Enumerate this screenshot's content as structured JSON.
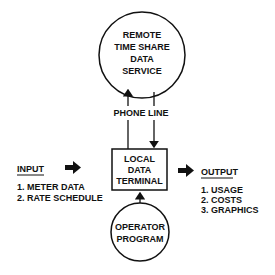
{
  "remote_service": {
    "lines": [
      "REMOTE",
      "TIME SHARE",
      "DATA",
      "SERVICE"
    ]
  },
  "connection_label": "PHONE LINE",
  "terminal": {
    "lines": [
      "LOCAL",
      "DATA",
      "TERMINAL"
    ]
  },
  "operator": {
    "lines": [
      "OPERATOR",
      "PROGRAM"
    ]
  },
  "input": {
    "heading": "INPUT",
    "items": [
      "1.  METER DATA",
      "2.  RATE SCHEDULE"
    ]
  },
  "output": {
    "heading": "OUTPUT",
    "items": [
      "1.  USAGE",
      "2.  COSTS",
      "3.  GRAPHICS"
    ]
  }
}
